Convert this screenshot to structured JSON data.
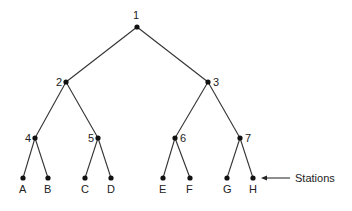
{
  "diagram": {
    "type": "binary-tree",
    "nodes": [
      {
        "id": "1",
        "label": "1",
        "x": 137,
        "y": 27,
        "lx": 133,
        "ly": 19
      },
      {
        "id": "2",
        "label": "2",
        "x": 66,
        "y": 82,
        "lx": 56,
        "ly": 86
      },
      {
        "id": "3",
        "label": "3",
        "x": 208,
        "y": 82,
        "lx": 213,
        "ly": 86
      },
      {
        "id": "4",
        "label": "4",
        "x": 35,
        "y": 138,
        "lx": 25,
        "ly": 142
      },
      {
        "id": "5",
        "label": "5",
        "x": 98,
        "y": 138,
        "lx": 88,
        "ly": 142
      },
      {
        "id": "6",
        "label": "6",
        "x": 175,
        "y": 138,
        "lx": 180,
        "ly": 142
      },
      {
        "id": "7",
        "label": "7",
        "x": 240,
        "y": 138,
        "lx": 245,
        "ly": 142
      },
      {
        "id": "A",
        "label": "A",
        "x": 23,
        "y": 178,
        "lx": 19,
        "ly": 193
      },
      {
        "id": "B",
        "label": "B",
        "x": 48,
        "y": 178,
        "lx": 44,
        "ly": 193
      },
      {
        "id": "C",
        "label": "C",
        "x": 85,
        "y": 178,
        "lx": 81,
        "ly": 193
      },
      {
        "id": "D",
        "label": "D",
        "x": 111,
        "y": 178,
        "lx": 107,
        "ly": 193
      },
      {
        "id": "E",
        "label": "E",
        "x": 163,
        "y": 178,
        "lx": 159,
        "ly": 193
      },
      {
        "id": "F",
        "label": "F",
        "x": 190,
        "y": 178,
        "lx": 186,
        "ly": 193
      },
      {
        "id": "G",
        "label": "G",
        "x": 227,
        "y": 178,
        "lx": 223,
        "ly": 193
      },
      {
        "id": "H",
        "label": "H",
        "x": 253,
        "y": 178,
        "lx": 249,
        "ly": 193
      }
    ],
    "edges": [
      [
        "1",
        "2"
      ],
      [
        "1",
        "3"
      ],
      [
        "2",
        "4"
      ],
      [
        "2",
        "5"
      ],
      [
        "3",
        "6"
      ],
      [
        "3",
        "7"
      ],
      [
        "4",
        "A"
      ],
      [
        "4",
        "B"
      ],
      [
        "5",
        "C"
      ],
      [
        "5",
        "D"
      ],
      [
        "6",
        "E"
      ],
      [
        "6",
        "F"
      ],
      [
        "7",
        "G"
      ],
      [
        "7",
        "H"
      ]
    ],
    "annotation": {
      "label": "Stations",
      "points_to": "H",
      "x1": 290,
      "x2": 261,
      "y": 178,
      "tx": 295,
      "ty": 182
    }
  }
}
